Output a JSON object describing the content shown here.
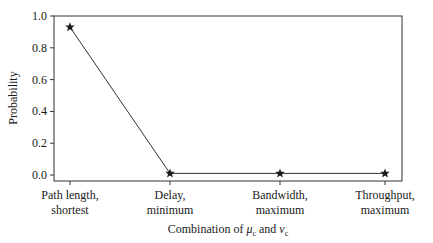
{
  "chart_data": {
    "type": "line",
    "title": "",
    "xlabel": "Combination of μc and νc",
    "xlabel_parts": {
      "prefix": "Combination of ",
      "mu": "μ",
      "mu_sub": "c",
      "mid": " and ",
      "nu": "ν",
      "nu_sub": "c"
    },
    "ylabel": "Probability",
    "categories": [
      [
        "Path length,",
        "shortest"
      ],
      [
        "Delay,",
        "minimum"
      ],
      [
        "Bandwidth,",
        "maximum"
      ],
      [
        "Throughput,",
        "maximum"
      ]
    ],
    "values": [
      0.93,
      0.01,
      0.01,
      0.01
    ],
    "ylim": [
      0.0,
      1.0
    ],
    "yticks": [
      "0.0",
      "0.2",
      "0.4",
      "0.6",
      "0.8",
      "1.0"
    ],
    "marker": "star",
    "grid": false,
    "legend": null,
    "line_color": "#333333"
  }
}
